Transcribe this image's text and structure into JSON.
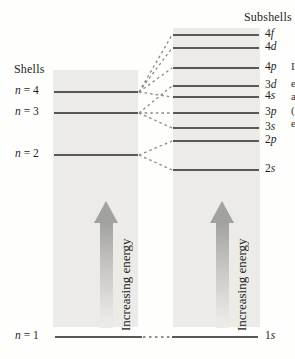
{
  "diagram": {
    "left_title": "Shells",
    "right_title": "Subshells",
    "energy_label": "Increasing energy",
    "colors": {
      "panel": "#ECEBE7",
      "level_line": "#585858",
      "connector_dash": "#8a8a8a",
      "arrow_gray": "#a1a19f"
    },
    "shells": [
      {
        "var": "n",
        "rest": " = 4",
        "y": 92
      },
      {
        "var": "n",
        "rest": " = 3",
        "y": 113
      },
      {
        "var": "n",
        "rest": " = 2",
        "y": 155
      },
      {
        "var": "n",
        "rest": " = 1",
        "y": 337
      }
    ],
    "subshells": [
      {
        "num": "4",
        "letter": "f",
        "y": 35
      },
      {
        "num": "4",
        "letter": "d",
        "y": 48
      },
      {
        "num": "4",
        "letter": "p",
        "y": 68
      },
      {
        "num": "3",
        "letter": "d",
        "y": 86
      },
      {
        "num": "4",
        "letter": "s",
        "y": 97
      },
      {
        "num": "3",
        "letter": "p",
        "y": 113
      },
      {
        "num": "3",
        "letter": "s",
        "y": 128
      },
      {
        "num": "2",
        "letter": "p",
        "y": 141
      },
      {
        "num": "2",
        "letter": "s",
        "y": 170
      },
      {
        "num": "1",
        "letter": "s",
        "y": 337
      }
    ],
    "connectors": [
      {
        "from_y": 92,
        "to_y": 35
      },
      {
        "from_y": 92,
        "to_y": 48
      },
      {
        "from_y": 92,
        "to_y": 68
      },
      {
        "from_y": 92,
        "to_y": 97
      },
      {
        "from_y": 113,
        "to_y": 86
      },
      {
        "from_y": 113,
        "to_y": 113
      },
      {
        "from_y": 113,
        "to_y": 128
      },
      {
        "from_y": 155,
        "to_y": 141
      },
      {
        "from_y": 155,
        "to_y": 170
      }
    ],
    "edge_fragments": [
      {
        "text": "I",
        "y": 60
      },
      {
        "text": "e",
        "y": 77
      },
      {
        "text": "a",
        "y": 90
      },
      {
        "text": "(",
        "y": 104
      },
      {
        "text": "e",
        "y": 117
      }
    ]
  }
}
